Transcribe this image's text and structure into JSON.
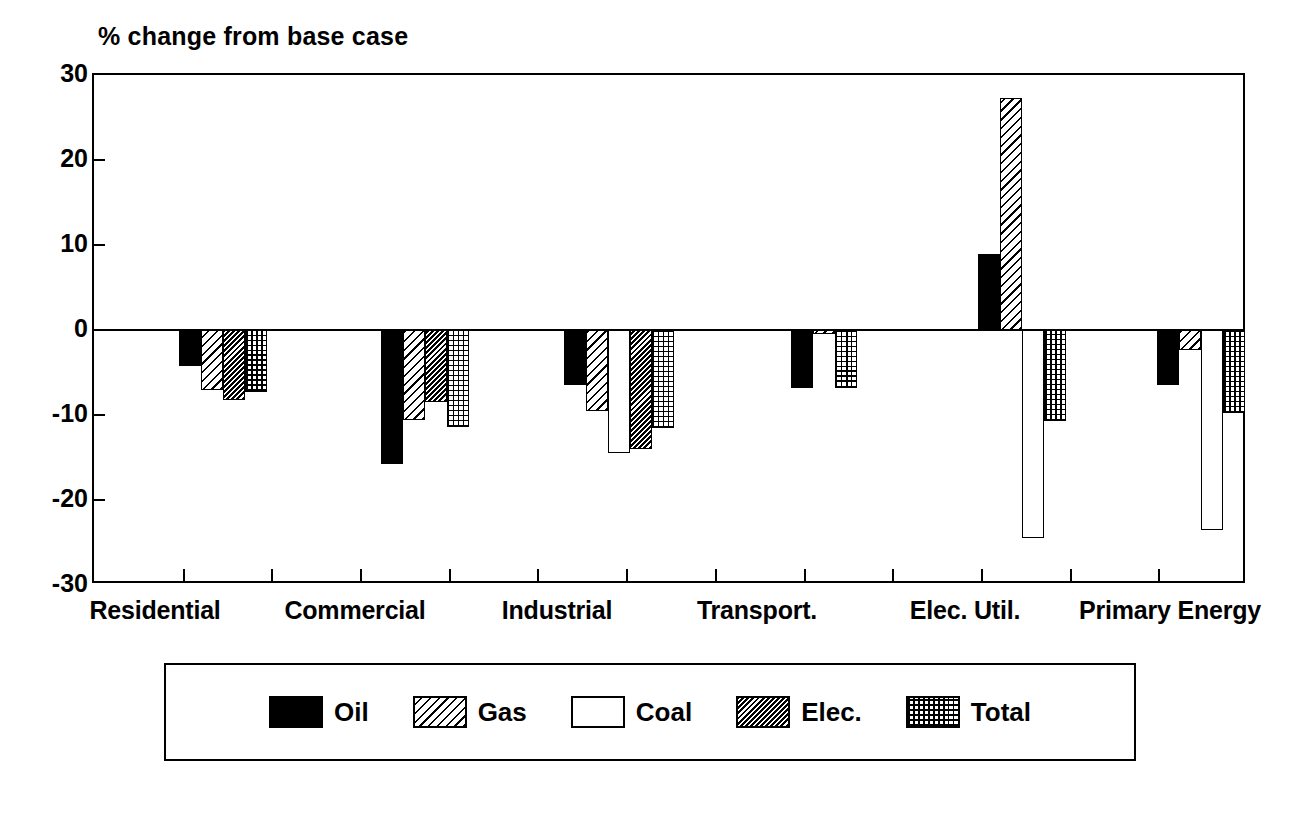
{
  "chart_data": {
    "type": "bar",
    "title": "",
    "ylabel": "% change from base case",
    "xlabel": "",
    "ylim": [
      -30,
      30
    ],
    "yticks": [
      30,
      20,
      10,
      0,
      -10,
      -20,
      -30
    ],
    "ytick_labels": [
      "30",
      "20",
      "10",
      "0",
      "-10",
      "-20",
      "-30"
    ],
    "grid": false,
    "legend_position": "bottom",
    "orientation": "vertical",
    "zero_reference_line": true,
    "categories": [
      "Residential",
      "Commercial",
      "Industrial",
      "Transport.",
      "Elec. Util.",
      "Primary Energy"
    ],
    "series": [
      {
        "name": "Oil",
        "pattern": "solid-black",
        "color": "#000000",
        "values": [
          -4.2,
          -15.8,
          -6.5,
          -6.8,
          9.0,
          -6.5
        ]
      },
      {
        "name": "Gas",
        "pattern": "sparse-diagonal-hatch",
        "color": "#000000",
        "values": [
          -7.0,
          -10.6,
          -9.5,
          -0.5,
          27.3,
          -2.3
        ]
      },
      {
        "name": "Coal",
        "pattern": "open-white",
        "color": "#ffffff",
        "values": [
          null,
          null,
          -14.5,
          null,
          -24.5,
          -23.5
        ]
      },
      {
        "name": "Elec.",
        "pattern": "dense-diagonal-hatch",
        "color": "#000000",
        "values": [
          -8.2,
          -8.5,
          -14.0,
          null,
          null,
          null
        ]
      },
      {
        "name": "Total",
        "pattern": "dotted-grid",
        "color": "#000000",
        "values": [
          -7.3,
          -11.4,
          -11.5,
          -6.8,
          -10.7,
          -9.8
        ]
      }
    ]
  },
  "axis": {
    "ylabel": "% change from base case",
    "ytick_labels": [
      "30",
      "20",
      "10",
      "0",
      "-10",
      "-20",
      "-30"
    ],
    "xcat_labels": [
      "Residential",
      "Commercial",
      "Industrial",
      "Transport.",
      "Elec. Util.",
      "Primary Energy"
    ]
  },
  "legend": {
    "entries": [
      {
        "label": "Oil",
        "pattern": "solid-black"
      },
      {
        "label": "Gas",
        "pattern": "sparse-diagonal-hatch"
      },
      {
        "label": "Coal",
        "pattern": "open-white"
      },
      {
        "label": "Elec.",
        "pattern": "dense-diagonal-hatch"
      },
      {
        "label": "Total",
        "pattern": "dotted-grid"
      }
    ]
  }
}
